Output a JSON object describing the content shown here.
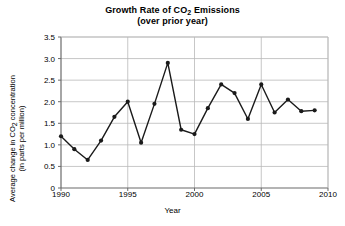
{
  "chart_data": {
    "type": "line",
    "title": "Growth Rate of CO2 Emissions",
    "title_line1_pre": "Growth Rate of CO",
    "title_line1_sub": "2",
    "title_line1_post": " Emissions",
    "subtitle": "(over prior year)",
    "xlabel": "Year",
    "ylabel": "Average change in CO2 concentration (in parts per million)",
    "ylabel_line1_pre": "Average change in CO",
    "ylabel_line1_sub": "2",
    "ylabel_line1_post": " concentration",
    "ylabel_line2": "(in parts per million)",
    "x": [
      1990,
      1991,
      1992,
      1993,
      1994,
      1995,
      1996,
      1997,
      1998,
      1999,
      2000,
      2001,
      2002,
      2003,
      2004,
      2005,
      2006,
      2007,
      2008,
      2009
    ],
    "values": [
      1.2,
      0.9,
      0.65,
      1.1,
      1.65,
      2.0,
      1.05,
      1.95,
      2.9,
      1.35,
      1.25,
      1.85,
      2.4,
      2.2,
      1.6,
      2.4,
      1.75,
      2.05,
      1.78,
      1.8
    ],
    "xlim": [
      1990,
      2010
    ],
    "ylim": [
      0,
      3.5
    ],
    "xticks": [
      1990,
      1995,
      2000,
      2005,
      2010
    ],
    "xtick_labels": [
      "1990",
      "1995",
      "2000",
      "2005",
      "2010"
    ],
    "yticks": [
      0,
      0.5,
      1.0,
      1.5,
      2.0,
      2.5,
      3.0,
      3.5
    ],
    "ytick_labels": [
      "0",
      "0.5",
      "1.0",
      "1.5",
      "2.0",
      "2.5",
      "3.0",
      "3.5"
    ],
    "grid": true,
    "grid_color": "#b9b9b9",
    "line_color": "#1a1a1a",
    "marker_color": "#1a1a1a",
    "marker": "circle",
    "legend": null,
    "background": "#ffffff"
  }
}
